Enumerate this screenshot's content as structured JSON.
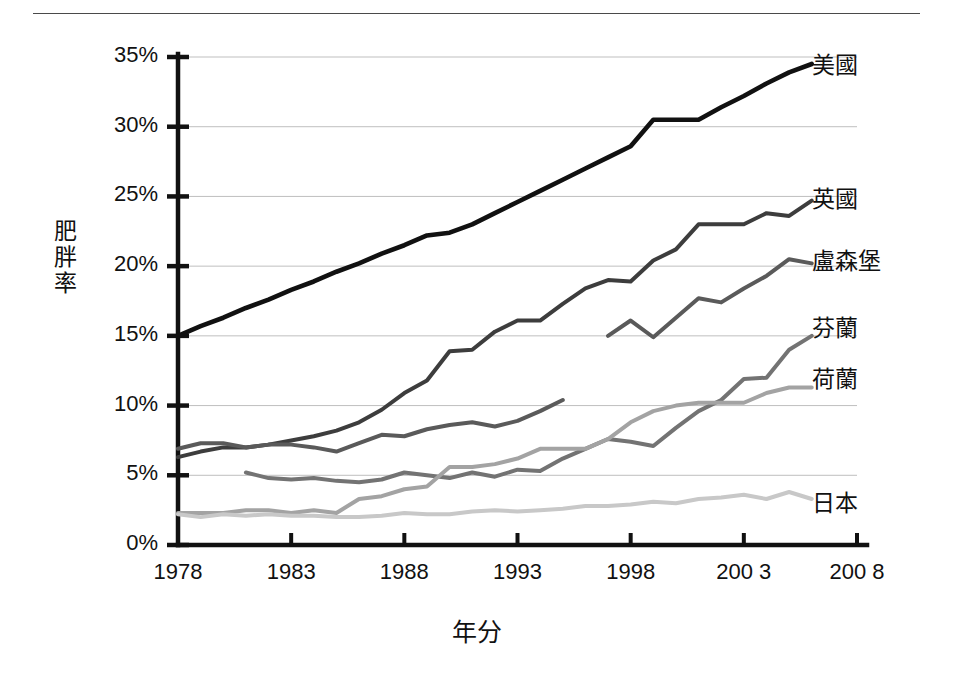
{
  "chart_data": {
    "type": "line",
    "title": "",
    "xlabel": "年分",
    "ylabel": "肥胖率",
    "xlim": [
      1978,
      2008
    ],
    "ylim": [
      0,
      35
    ],
    "grid": "horizontal",
    "legend_position": "right-of-line-ends",
    "y_ticks": [
      "0%",
      "5%",
      "10%",
      "15%",
      "20%",
      "25%",
      "30%",
      "35%"
    ],
    "y_tick_values": [
      0,
      5,
      10,
      15,
      20,
      25,
      30,
      35
    ],
    "x_ticks": [
      "1978",
      "1983",
      "1988",
      "1993",
      "1998",
      "200 3",
      "200 8"
    ],
    "x_tick_values": [
      1978,
      1983,
      1988,
      1993,
      1998,
      2003,
      2008
    ],
    "series": [
      {
        "name": "美國",
        "color": "#111111",
        "width": 4.6,
        "label_x": 812,
        "label_y": 62,
        "x": [
          1978,
          1979,
          1980,
          1981,
          1982,
          1983,
          1984,
          1985,
          1986,
          1987,
          1988,
          1989,
          1990,
          1991,
          1992,
          1993,
          1994,
          1995,
          1996,
          1997,
          1998,
          1999,
          2000,
          2001,
          2002,
          2003,
          2004,
          2005,
          2006
        ],
        "values": [
          15.0,
          15.7,
          16.3,
          17.0,
          17.6,
          18.3,
          18.9,
          19.6,
          20.2,
          20.9,
          21.5,
          22.2,
          22.4,
          23.0,
          23.8,
          24.6,
          25.4,
          26.2,
          27.0,
          27.8,
          28.6,
          30.5,
          30.5,
          30.5,
          31.4,
          32.2,
          33.1,
          33.9,
          34.5
        ]
      },
      {
        "name": "英國",
        "color": "#3d3d3d",
        "width": 4.0,
        "label_x": 812,
        "label_y": 196,
        "x": [
          1978,
          1979,
          1980,
          1981,
          1982,
          1983,
          1984,
          1985,
          1986,
          1987,
          1988,
          1989,
          1990,
          1991,
          1992,
          1993,
          1994,
          1995,
          1996,
          1997,
          1998,
          1999,
          2000,
          2001,
          2002,
          2003,
          2004,
          2005,
          2006
        ],
        "values": [
          6.3,
          6.7,
          7.0,
          7.0,
          7.2,
          7.5,
          7.8,
          8.2,
          8.8,
          9.7,
          10.9,
          11.8,
          13.9,
          14.0,
          15.3,
          16.1,
          16.1,
          17.3,
          18.4,
          19.0,
          18.9,
          20.4,
          21.2,
          23.0,
          23.0,
          23.0,
          23.8,
          23.6,
          24.7
        ]
      },
      {
        "name": "盧森堡",
        "color": "#5a5a5a",
        "width": 4.0,
        "label_x": 812,
        "label_y": 258,
        "segments": [
          {
            "x": [
              1978,
              1979,
              1980,
              1981,
              1982,
              1983,
              1984,
              1985,
              1986,
              1987,
              1988,
              1989,
              1990,
              1991,
              1992,
              1993,
              1994,
              1995
            ],
            "values": [
              6.9,
              7.3,
              7.3,
              7.0,
              7.2,
              7.2,
              7.0,
              6.7,
              7.3,
              7.9,
              7.8,
              8.3,
              8.6,
              8.8,
              8.5,
              8.9,
              9.6,
              10.4
            ]
          },
          {
            "x": [
              1997,
              1998,
              1999,
              2000,
              2001,
              2002,
              2003,
              2004,
              2005,
              2006
            ],
            "values": [
              15.0,
              16.1,
              14.9,
              16.3,
              17.7,
              17.4,
              18.4,
              19.3,
              20.5,
              20.2
            ]
          }
        ]
      },
      {
        "name": "芬蘭",
        "color": "#737373",
        "width": 4.0,
        "label_x": 812,
        "label_y": 325,
        "x": [
          1981,
          1982,
          1983,
          1984,
          1985,
          1986,
          1987,
          1988,
          1989,
          1990,
          1991,
          1992,
          1993,
          1994,
          1995,
          1996,
          1997,
          1998,
          1999,
          2000,
          2001,
          2002,
          2003,
          2004,
          2005,
          2006
        ],
        "values": [
          5.2,
          4.8,
          4.7,
          4.8,
          4.6,
          4.5,
          4.7,
          5.2,
          5.0,
          4.8,
          5.2,
          4.9,
          5.4,
          5.3,
          6.2,
          6.9,
          7.6,
          7.4,
          7.1,
          8.4,
          9.6,
          10.4,
          11.9,
          12.0,
          14.0,
          15.0
        ]
      },
      {
        "name": "荷蘭",
        "color": "#a3a3a3",
        "width": 4.0,
        "label_x": 812,
        "label_y": 376,
        "x": [
          1978,
          1979,
          1980,
          1981,
          1982,
          1983,
          1984,
          1985,
          1986,
          1987,
          1988,
          1989,
          1990,
          1991,
          1992,
          1993,
          1994,
          1995,
          1996,
          1997,
          1998,
          1999,
          2000,
          2001,
          2002,
          2003,
          2004,
          2005,
          2006
        ],
        "values": [
          2.3,
          2.3,
          2.3,
          2.5,
          2.5,
          2.3,
          2.5,
          2.3,
          3.3,
          3.5,
          4.0,
          4.2,
          5.6,
          5.6,
          5.8,
          6.2,
          6.9,
          6.9,
          6.9,
          7.6,
          8.8,
          9.6,
          10.0,
          10.2,
          10.2,
          10.2,
          10.9,
          11.3,
          11.3
        ]
      },
      {
        "name": "日本",
        "color": "#c8c8c8",
        "width": 4.0,
        "label_x": 812,
        "label_y": 500,
        "x": [
          1978,
          1979,
          1980,
          1981,
          1982,
          1983,
          1984,
          1985,
          1986,
          1987,
          1988,
          1989,
          1990,
          1991,
          1992,
          1993,
          1994,
          1995,
          1996,
          1997,
          1998,
          1999,
          2000,
          2001,
          2002,
          2003,
          2004,
          2005,
          2006
        ],
        "values": [
          2.2,
          2.0,
          2.2,
          2.1,
          2.2,
          2.1,
          2.1,
          2.0,
          2.0,
          2.1,
          2.3,
          2.2,
          2.2,
          2.4,
          2.5,
          2.4,
          2.5,
          2.6,
          2.8,
          2.8,
          2.9,
          3.1,
          3.0,
          3.3,
          3.4,
          3.6,
          3.3,
          3.8,
          3.3
        ]
      }
    ]
  }
}
